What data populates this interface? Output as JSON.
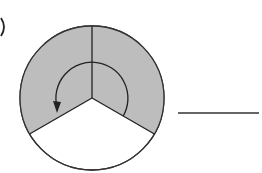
{
  "figure": {
    "label_paren": ")",
    "sectors": [
      {
        "name": "upper-left",
        "shaded": true
      },
      {
        "name": "upper-right",
        "shaded": true
      },
      {
        "name": "bottom",
        "shaded": false
      }
    ],
    "shaded_fraction_numerator": 2,
    "total_parts": 3,
    "answer_blank": ""
  },
  "colors": {
    "shade": "#bdbdbd",
    "stroke": "#222222",
    "background": "#ffffff"
  }
}
